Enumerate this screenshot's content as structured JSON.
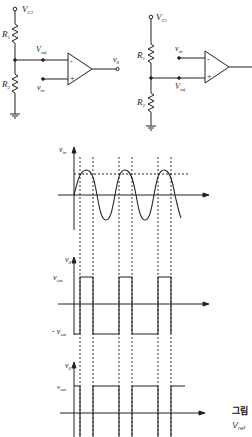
{
  "circuit_left": {
    "supply": "V",
    "supply_sub": "C1",
    "r1": "R",
    "r1_sub": "1",
    "r2": "R",
    "r2_sub": "2",
    "ref": "V",
    "ref_sub": "ref",
    "input": "v",
    "input_sub": "in",
    "output": "v",
    "output_sub": "0",
    "minus": "-",
    "plus": "+"
  },
  "circuit_right": {
    "supply": "V",
    "supply_sub": "C1",
    "r1": "R",
    "r1_sub": "1",
    "r2": "R",
    "r2_sub": "2",
    "ref": "V",
    "ref_sub": "ref",
    "input": "v",
    "input_sub": "in",
    "minus": "-",
    "plus": "+"
  },
  "waveform_vin": {
    "axis_label": "v",
    "axis_sub": "in"
  },
  "waveform_vo1": {
    "axis_label": "v",
    "axis_sub": "0",
    "high": "v",
    "high_sub": "sat",
    "low": "- v",
    "low_sub": "sat"
  },
  "waveform_vo2": {
    "axis_label": "v",
    "axis_sub": "0",
    "high": "v",
    "high_sub": "sat"
  },
  "caption": {
    "title": "그림",
    "line2": "V",
    "line2_sub": "ref"
  }
}
